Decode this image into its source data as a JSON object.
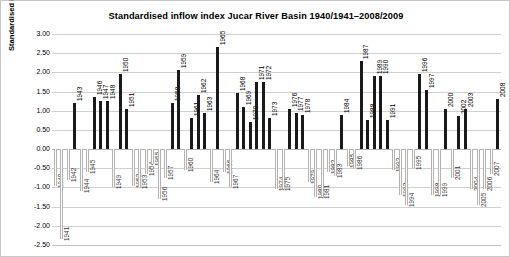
{
  "chart_data": {
    "type": "bar",
    "title": "Standardised inflow index Jucar River Basin 1940/1941–2008/2009",
    "xlabel": "",
    "ylabel": "Standardised inflow index",
    "ylim": [
      -2.5,
      3.0
    ],
    "ytick_labels": [
      "3.00",
      "2.50",
      "2.00",
      "1.50",
      "1.00",
      "0.50",
      "0.00",
      "-0.50",
      "-1.00",
      "-1.50",
      "-2.00",
      "-2.50"
    ],
    "ytick_values": [
      3.0,
      2.5,
      2.0,
      1.5,
      1.0,
      0.5,
      0.0,
      -0.5,
      -1.0,
      -1.5,
      -2.0,
      -2.5
    ],
    "grid": true,
    "legend": "none",
    "categories": [
      "1940",
      "1941",
      "1942",
      "1943",
      "1944",
      "1945",
      "1946",
      "1947",
      "1948",
      "1949",
      "1950",
      "1951",
      "1952",
      "1953",
      "1954",
      "1955",
      "1956",
      "1957",
      "1958",
      "1959",
      "1960",
      "1961",
      "1962",
      "1963",
      "1964",
      "1965",
      "1966",
      "1967",
      "1968",
      "1969",
      "1970",
      "1971",
      "1972",
      "1973",
      "1974",
      "1975",
      "1976",
      "1977",
      "1978",
      "1979",
      "1980",
      "1981",
      "1982",
      "1983",
      "1984",
      "1985",
      "1986",
      "1987",
      "1988",
      "1989",
      "1990",
      "1991",
      "1992",
      "1993",
      "1994",
      "1995",
      "1996",
      "1997",
      "1998",
      "1999",
      "2000",
      "2001",
      "2002",
      "2003",
      "2004",
      "2005",
      "2006",
      "2007",
      "2008"
    ],
    "values": [
      -0.95,
      -2.35,
      -0.8,
      1.2,
      -1.1,
      -0.6,
      1.35,
      1.25,
      1.25,
      -1.0,
      1.95,
      1.05,
      -0.95,
      -1.0,
      -0.65,
      -0.4,
      -1.3,
      -0.75,
      1.2,
      2.05,
      -0.55,
      0.8,
      1.4,
      0.95,
      -0.85,
      2.65,
      -0.6,
      -1.0,
      1.45,
      1.1,
      0.7,
      1.75,
      1.75,
      0.8,
      -1.05,
      -1.05,
      1.05,
      0.95,
      0.9,
      -0.85,
      -1.25,
      -1.25,
      -0.6,
      -0.7,
      0.9,
      -0.45,
      -0.5,
      2.3,
      0.75,
      1.9,
      1.9,
      0.75,
      -0.55,
      -1.2,
      -1.45,
      -0.5,
      1.95,
      1.55,
      -1.2,
      -1.2,
      1.05,
      -0.75,
      0.85,
      1.05,
      -1.05,
      -1.45,
      -1.05,
      -0.65,
      1.3
    ]
  }
}
